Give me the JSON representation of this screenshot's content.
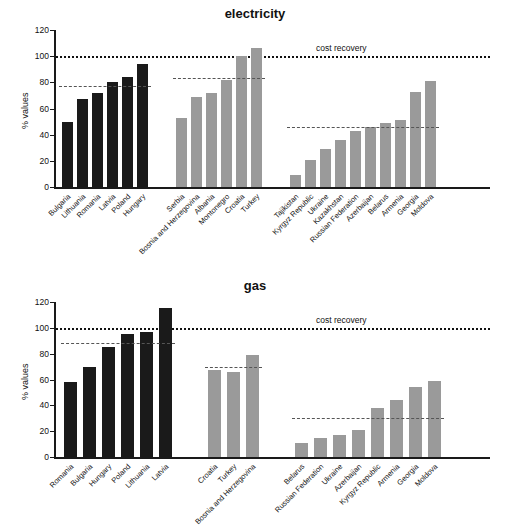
{
  "charts": [
    {
      "title": "electricity",
      "ylabel": "% values",
      "ylim": [
        0,
        120
      ],
      "yticks": [
        0,
        20,
        40,
        60,
        80,
        100,
        120
      ],
      "cost_recovery_label": "cost recovery",
      "cost_recovery_value": 100,
      "groups": [
        {
          "name": "EU new member states",
          "color": "#1a1a1a",
          "average": 77,
          "categories": [
            "Bulgaria",
            "Lithuania",
            "Romania",
            "Latvia",
            "Poland",
            "Hungary"
          ],
          "values": [
            50,
            67,
            72,
            80,
            84,
            94
          ]
        },
        {
          "name": "South Eastern Europe",
          "color": "#9a9a9a",
          "average": 83,
          "categories": [
            "Serbia",
            "Bosnia and Herzegovina",
            "Albania",
            "Montonegro",
            "Croatia",
            "Turkey"
          ],
          "values": [
            53,
            69,
            72,
            82,
            100,
            106
          ]
        },
        {
          "name": "CIS",
          "color": "#9a9a9a",
          "average": 46,
          "categories": [
            "Tajikistan",
            "Kyrgyz Republic",
            "Ukraine",
            "Kazakhstan",
            "Russian Federation",
            "Azerbaijan",
            "Belarus",
            "Armenia",
            "Georgia",
            "Moldova"
          ],
          "values": [
            9,
            21,
            29,
            36,
            43,
            46,
            49,
            51,
            73,
            81
          ]
        }
      ]
    },
    {
      "title": "gas",
      "ylabel": "% values",
      "ylim": [
        0,
        120
      ],
      "yticks": [
        0,
        20,
        40,
        60,
        80,
        100,
        120
      ],
      "cost_recovery_label": "cost recovery",
      "cost_recovery_value": 100,
      "groups": [
        {
          "name": "EU new member states",
          "color": "#1a1a1a",
          "average": 88,
          "categories": [
            "Romania",
            "Bulgaria",
            "Hungary",
            "Poland",
            "Lithuania",
            "Latvia"
          ],
          "values": [
            58,
            70,
            85,
            95,
            97,
            115
          ]
        },
        {
          "name": "South Eastern Europe",
          "color": "#9a9a9a",
          "average": 70,
          "categories": [
            "Croatia",
            "Turkey",
            "Bosnia and Herzegovina"
          ],
          "values": [
            67,
            66,
            79
          ]
        },
        {
          "name": "CIS",
          "color": "#9a9a9a",
          "average": 30,
          "categories": [
            "Belarus",
            "Russian Federation",
            "Ukraine",
            "Azerbaijan",
            "Kyrgyz Republic",
            "Armenia",
            "Georgia",
            "Moldova"
          ],
          "values": [
            11,
            15,
            17,
            21,
            38,
            44,
            54,
            59
          ]
        }
      ]
    }
  ],
  "chart_data": {
    "type": "bar",
    "panels": [
      {
        "title": "electricity",
        "ylabel": "% values",
        "ylim": [
          0,
          120
        ],
        "yticks": [
          0,
          20,
          40,
          60,
          80,
          100,
          120
        ],
        "grid": false,
        "legend": "none",
        "annotations": [
          {
            "text": "cost recovery",
            "y": 100,
            "style": "dotted"
          },
          {
            "text": "group average",
            "y": 77,
            "style": "dashed",
            "group": "EU new member states"
          },
          {
            "text": "group average",
            "y": 83,
            "style": "dashed",
            "group": "South Eastern Europe"
          },
          {
            "text": "group average",
            "y": 46,
            "style": "dashed",
            "group": "CIS"
          }
        ],
        "categories": [
          "Bulgaria",
          "Lithuania",
          "Romania",
          "Latvia",
          "Poland",
          "Hungary",
          "Serbia",
          "Bosnia and Herzegovina",
          "Albania",
          "Montonegro",
          "Croatia",
          "Turkey",
          "Tajikistan",
          "Kyrgyz Republic",
          "Ukraine",
          "Kazakhstan",
          "Russian Federation",
          "Azerbaijan",
          "Belarus",
          "Armenia",
          "Georgia",
          "Moldova"
        ],
        "values": [
          50,
          67,
          72,
          80,
          84,
          94,
          53,
          69,
          72,
          82,
          100,
          106,
          9,
          21,
          29,
          36,
          43,
          46,
          49,
          51,
          73,
          81
        ]
      },
      {
        "title": "gas",
        "ylabel": "% values",
        "ylim": [
          0,
          120
        ],
        "yticks": [
          0,
          20,
          40,
          60,
          80,
          100,
          120
        ],
        "grid": false,
        "legend": "none",
        "annotations": [
          {
            "text": "cost recovery",
            "y": 100,
            "style": "dotted"
          },
          {
            "text": "group average",
            "y": 88,
            "style": "dashed",
            "group": "EU new member states"
          },
          {
            "text": "group average",
            "y": 70,
            "style": "dashed",
            "group": "South Eastern Europe"
          },
          {
            "text": "group average",
            "y": 30,
            "style": "dashed",
            "group": "CIS"
          }
        ],
        "categories": [
          "Romania",
          "Bulgaria",
          "Hungary",
          "Poland",
          "Lithuania",
          "Latvia",
          "Croatia",
          "Turkey",
          "Bosnia and Herzegovina",
          "Belarus",
          "Russian Federation",
          "Ukraine",
          "Azerbaijan",
          "Kyrgyz Republic",
          "Armenia",
          "Georgia",
          "Moldova"
        ],
        "values": [
          58,
          70,
          85,
          95,
          97,
          115,
          67,
          66,
          79,
          11,
          15,
          17,
          21,
          38,
          44,
          54,
          59
        ]
      }
    ]
  }
}
